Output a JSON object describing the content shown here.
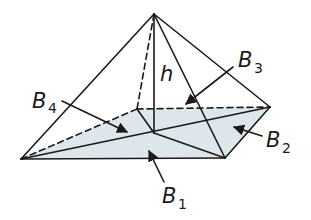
{
  "figure": {
    "colors": {
      "line": "#1a1a1a",
      "base_fill": "#dde6ea",
      "background": "#ffffff"
    },
    "labels": {
      "height": "h",
      "b1": {
        "main": "B",
        "sub": "1"
      },
      "b2": {
        "main": "B",
        "sub": "2"
      },
      "b3": {
        "main": "B",
        "sub": "3"
      },
      "b4": {
        "main": "B",
        "sub": "4"
      }
    }
  }
}
